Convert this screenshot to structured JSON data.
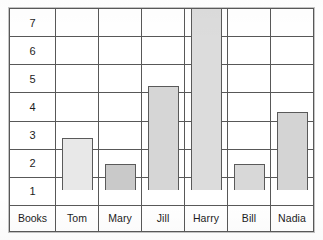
{
  "chart_data": {
    "type": "bar",
    "title": "",
    "xlabel": "",
    "ylabel": "Books",
    "categories": [
      "Tom",
      "Mary",
      "Jill",
      "Harry",
      "Bill",
      "Nadia"
    ],
    "values": [
      2,
      1,
      4,
      7,
      1,
      3
    ],
    "ylim": [
      0,
      7
    ],
    "ytick_labels": [
      "7",
      "6",
      "5",
      "4",
      "3",
      "2",
      "1"
    ],
    "ytick_values": [
      7,
      6,
      5,
      4,
      3,
      2,
      1
    ],
    "grid": true,
    "legend": null,
    "bar_colors": [
      "#e8e8e8",
      "#c9c9c9",
      "#d6d6d6",
      "#dcdcdc",
      "#d8d8d8",
      "#d4d4d4"
    ],
    "grid_line_color": "#585858",
    "frame_color": "#4a4a4a",
    "text_color": "#1c1c1c",
    "background": "#ffffff"
  },
  "axis": {
    "corner_label": "Books",
    "ticks": [
      {
        "label": "7"
      },
      {
        "label": "6"
      },
      {
        "label": "5"
      },
      {
        "label": "4"
      },
      {
        "label": "3"
      },
      {
        "label": "2"
      },
      {
        "label": "1"
      }
    ]
  },
  "categories": [
    {
      "label": "Tom",
      "value": 2
    },
    {
      "label": "Mary",
      "value": 1
    },
    {
      "label": "Jill",
      "value": 4
    },
    {
      "label": "Harry",
      "value": 7
    },
    {
      "label": "Bill",
      "value": 1
    },
    {
      "label": "Nadia",
      "value": 3
    }
  ]
}
